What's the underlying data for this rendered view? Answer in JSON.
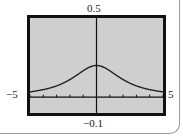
{
  "chart_data": {
    "type": "line",
    "title": "",
    "xlabel": "",
    "ylabel": "",
    "xlim": [
      -5,
      5
    ],
    "ylim": [
      -0.1,
      0.5
    ],
    "xscale": 1,
    "labels": {
      "xmin": "−5",
      "xmax": "5",
      "ymin": "−0.1",
      "ymax": "0.5"
    },
    "grid": false,
    "series": [
      {
        "name": "f(x)",
        "x": [
          -5,
          -4.5,
          -4,
          -3.5,
          -3,
          -2.5,
          -2,
          -1.5,
          -1,
          -0.5,
          0,
          0.5,
          1,
          1.5,
          2,
          2.5,
          3,
          3.5,
          4,
          4.5,
          5
        ],
        "values": [
          0.033,
          0.039,
          0.048,
          0.058,
          0.071,
          0.089,
          0.111,
          0.138,
          0.167,
          0.19,
          0.2,
          0.19,
          0.167,
          0.138,
          0.111,
          0.089,
          0.071,
          0.058,
          0.048,
          0.039,
          0.033
        ]
      }
    ],
    "colors": {
      "screen": "#cfcfcf",
      "frame": "#111111",
      "curve": "#222222",
      "axis": "#111111"
    }
  }
}
